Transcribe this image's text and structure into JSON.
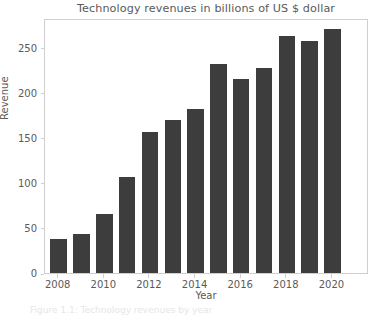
{
  "chart_data": {
    "type": "bar",
    "title": "Technology revenues in billions of US $ dollar",
    "xlabel": "Year",
    "ylabel": "Revenue",
    "categories": [
      2008,
      2009,
      2010,
      2011,
      2012,
      2013,
      2014,
      2015,
      2016,
      2017,
      2018,
      2019,
      2020,
      2021
    ],
    "values": [
      38,
      43,
      66,
      107,
      156,
      170,
      182,
      232,
      215,
      228,
      263,
      258,
      271,
      0
    ],
    "xlim": [
      2007.4,
      2021.6
    ],
    "ylim": [
      0,
      283
    ],
    "xticks": [
      2008,
      2010,
      2012,
      2014,
      2016,
      2018,
      2020
    ],
    "xtick_labels": [
      "2008",
      "2010",
      "2012",
      "2014",
      "2016",
      "2018",
      "2020"
    ],
    "yticks": [
      0,
      50,
      100,
      150,
      200,
      250
    ],
    "ytick_labels": [
      "0",
      "50",
      "100",
      "150",
      "200",
      "250"
    ],
    "grid": false,
    "legend": null,
    "bar_color": "#3d3d3d",
    "axes_color": "#cfcfcf",
    "text_color": "#5a5a5a",
    "background": "#ffffff"
  },
  "caption": {
    "text": "Figure 1.1: Technology revenues by year"
  }
}
